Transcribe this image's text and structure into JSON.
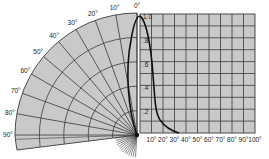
{
  "diagram": {
    "type": "polar-and-rectangular-radiation-pattern",
    "colors": {
      "background": "#ffffff",
      "grid_fill": "#c9c9c9",
      "grid_line": "#3a3a3a",
      "curve": "#111111",
      "label": "#222222"
    },
    "polar": {
      "angle_labels": [
        "0°",
        "10°",
        "20°",
        "30°",
        "40°",
        "50°",
        "60°",
        "70°",
        "80°",
        "90°"
      ],
      "angles_deg": [
        0,
        10,
        20,
        30,
        40,
        50,
        60,
        70,
        80,
        90
      ],
      "ring_count": 5
    },
    "rectangular": {
      "y_labels": [
        "1.0",
        ".8",
        ".6",
        ".4",
        ".2"
      ],
      "x_labels": [
        "10°",
        "20°",
        "30°",
        "40°",
        "50°",
        "60°",
        "70°",
        "80°",
        "90°",
        "100°"
      ],
      "columns": 10,
      "rows": 10
    }
  }
}
